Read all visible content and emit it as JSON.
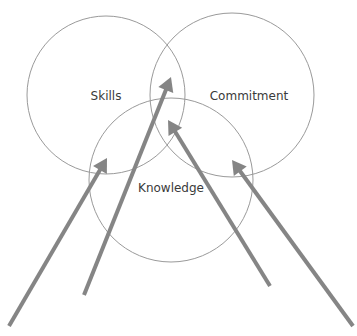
{
  "diagram": {
    "type": "venn",
    "colors": {
      "background": "#ffffff",
      "circle_stroke": "#9a9a9a",
      "arrow": "#858585",
      "text": "#3a3a3a"
    },
    "circles": [
      {
        "id": "skills",
        "label": "Skills",
        "cx": 106,
        "cy": 95,
        "r": 79,
        "label_x": 106,
        "label_y": 100
      },
      {
        "id": "commitment",
        "label": "Commitment",
        "cx": 232,
        "cy": 95,
        "r": 82,
        "label_x": 249,
        "label_y": 100
      },
      {
        "id": "knowledge",
        "label": "Knowledge",
        "cx": 171,
        "cy": 180,
        "r": 82,
        "label_x": 171,
        "label_y": 192
      }
    ],
    "arrows": [
      {
        "id": "arrow-1",
        "from": [
          9,
          326
        ],
        "to": [
          107,
          158
        ]
      },
      {
        "id": "arrow-2",
        "from": [
          84,
          295
        ],
        "to": [
          171,
          77
        ]
      },
      {
        "id": "arrow-3",
        "from": [
          270,
          286
        ],
        "to": [
          168,
          120
        ]
      },
      {
        "id": "arrow-4",
        "from": [
          353,
          326
        ],
        "to": [
          232,
          160
        ]
      }
    ]
  }
}
